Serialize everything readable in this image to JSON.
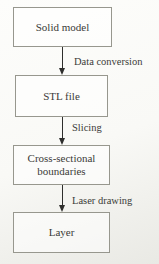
{
  "diagram": {
    "nodes": [
      {
        "label": "Solid model"
      },
      {
        "label": "STL file"
      },
      {
        "label": "Cross-sectional boundaries"
      },
      {
        "label": "Layer"
      }
    ],
    "arrows": [
      {
        "label": "Data conversion"
      },
      {
        "label": "Slicing"
      },
      {
        "label": "Laser drawing"
      }
    ],
    "colors": {
      "background": "#f9f9f6",
      "box_border": "#97978e",
      "text": "#3b3b38",
      "arrow": "#2e2e2c"
    }
  }
}
